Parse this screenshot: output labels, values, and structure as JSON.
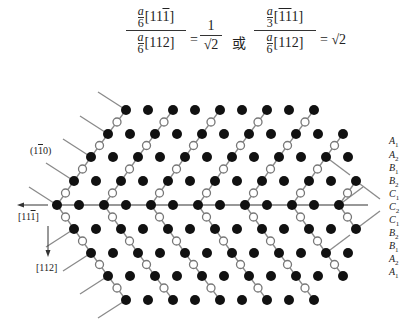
{
  "formula": {
    "left": {
      "num_coef_top": "a",
      "num_coef_bottom": "6",
      "num_dir": "[11",
      "num_dir_bar": "1",
      "num_dir_end": "]",
      "den_coef_top": "a",
      "den_coef_bottom": "6",
      "den_dir": "[112]",
      "equals": "=",
      "result_num": "1",
      "result_den": "√2"
    },
    "connector": "或",
    "right": {
      "num_coef_top": "a",
      "num_coef_bottom": "3",
      "num_dir_open": "[",
      "num_dir_bar1": "1",
      "num_dir_bar2": "1",
      "num_dir_end": "1]",
      "den_coef_top": "a",
      "den_coef_bottom": "6",
      "den_dir": "[112]",
      "equals": "= √2"
    }
  },
  "labels": {
    "plane": {
      "open": "(1",
      "bar": "1",
      "close": "0)"
    },
    "horizontal_dir": {
      "open": "[11",
      "bar": "1",
      "close": "]"
    },
    "vertical_dir": "[112]"
  },
  "stacking_layers": [
    {
      "letter": "A",
      "sub": "1"
    },
    {
      "letter": "A",
      "sub": "2"
    },
    {
      "letter": "B",
      "sub": "1"
    },
    {
      "letter": "B",
      "sub": "2"
    },
    {
      "letter": "C",
      "sub": "1"
    },
    {
      "letter": "C",
      "sub": "2"
    },
    {
      "letter": "C",
      "sub": "1"
    },
    {
      "letter": "B",
      "sub": "2"
    },
    {
      "letter": "B",
      "sub": "1"
    },
    {
      "letter": "A",
      "sub": "2"
    },
    {
      "letter": "A",
      "sub": "1"
    }
  ],
  "lattice": {
    "rows_y": [
      110,
      134,
      157,
      181,
      205,
      229,
      253,
      276,
      300
    ],
    "row_starts": [
      126,
      108,
      91,
      74,
      57,
      74,
      91,
      108,
      126
    ],
    "row_counts": [
      9,
      11,
      12,
      13,
      13,
      13,
      12,
      11,
      9
    ],
    "pitch_pair": [
      22,
      25
    ],
    "atom_radius": 5,
    "open_radius": 4,
    "colors": {
      "filled": "#111111",
      "open_stroke": "#777777",
      "line": "#8a8a8a",
      "axis": "#333333"
    }
  }
}
